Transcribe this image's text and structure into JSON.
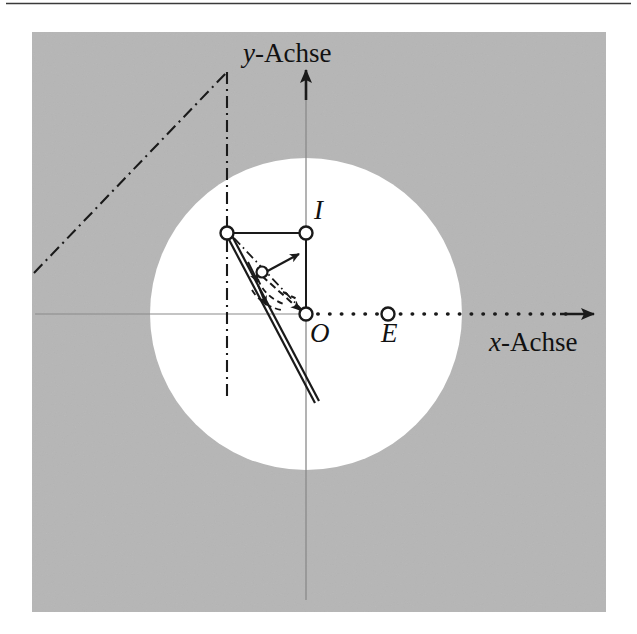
{
  "figure": {
    "background_color": "#ffffff",
    "panel_color": "#b6b6b6",
    "disk_color": "#ffffff",
    "ink_color": "#1a1a1a",
    "axis_color": "#7a7a7a",
    "panel": {
      "x": 32,
      "y": 32,
      "width": 574,
      "height": 580
    },
    "disk": {
      "cx": 306,
      "cy": 314,
      "r": 156
    },
    "top_rule_y": 3
  },
  "axes": {
    "x_label_prefix": "x",
    "x_label_suffix": "-Achse",
    "x_label_full": "x-Achse",
    "y_label_prefix": "y",
    "y_label_suffix": "-Achse",
    "y_label_full": "y-Achse",
    "origin": {
      "x": 306,
      "y": 314
    },
    "x_axis_from": 35,
    "x_axis_to": 596,
    "y_axis_from": 600,
    "y_axis_to": 68
  },
  "points": [
    {
      "id": "O",
      "label": "O",
      "x": 306,
      "y": 314,
      "label_dx": 4,
      "label_dy": 10,
      "marker": "open-circle"
    },
    {
      "id": "E",
      "label": "E",
      "x": 388,
      "y": 314,
      "label_dx": -7,
      "label_dy": 10,
      "marker": "open-circle"
    },
    {
      "id": "I",
      "label": "I",
      "x": 306,
      "y": 233,
      "label_dx": 8,
      "label_dy": -32,
      "marker": "open-circle"
    },
    {
      "id": "P",
      "label": "",
      "x": 227,
      "y": 233,
      "label_dx": 0,
      "label_dy": 0,
      "marker": "open-circle"
    },
    {
      "id": "M",
      "label": "",
      "x": 262,
      "y": 272,
      "label_dx": 0,
      "label_dy": 0,
      "marker": "open-circle-small"
    }
  ],
  "strokes": {
    "dashdot_diagonal": {
      "x1": 34,
      "y1": 273,
      "x2": 227,
      "y2": 72
    },
    "dashdot_vertical": {
      "x1": 227,
      "y1": 72,
      "x2": 227,
      "y2": 399
    },
    "rect_top": {
      "x1": 227,
      "y1": 233,
      "x2": 306,
      "y2": 233
    },
    "rect_right": {
      "x1": 306,
      "y1": 233,
      "x2": 306,
      "y2": 314
    },
    "double_line": {
      "x1": 224,
      "y1": 231,
      "x2": 312,
      "y2": 402
    },
    "dashdot_short": {
      "x1": 232,
      "y1": 236,
      "x2": 303,
      "y2": 312
    },
    "dotted_x_positive": {
      "x1": 306,
      "y1": 314,
      "x2": 590,
      "y2": 314
    }
  },
  "arrows": {
    "x_axis_arrowhead": {
      "x": 596,
      "y": 314,
      "direction": "right"
    },
    "y_axis_arrowhead": {
      "x": 306,
      "y": 68,
      "direction": "up"
    },
    "normal_vector": {
      "x1": 262,
      "y1": 272,
      "x2": 297,
      "y2": 256,
      "style": "solid"
    },
    "tangent_arc_1": {
      "label": "dashed-arc-upper"
    },
    "tangent_arc_2": {
      "label": "dashed-arc-lower"
    },
    "chord_arrow": {
      "x1": 262,
      "y1": 272,
      "x2": 302,
      "y2": 309,
      "style": "dashed"
    }
  },
  "legend_note": ""
}
